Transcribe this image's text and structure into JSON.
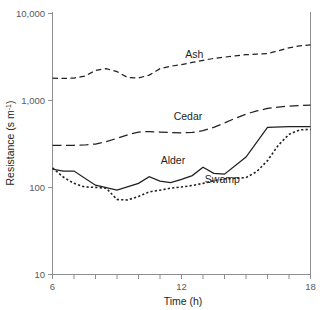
{
  "figure": {
    "name": "resistance-vs-time-line-chart"
  },
  "chart_data": {
    "type": "line",
    "title": "",
    "xlabel": "Time (h)",
    "ylabel": "Resistance (s m⁻¹)",
    "ylabel_parts": {
      "main": "Resistance (s m",
      "exponent": "-1",
      "tail": ")"
    },
    "xscale": "linear",
    "yscale": "log",
    "xlim": [
      6,
      18
    ],
    "ylim": [
      10,
      10000
    ],
    "xticks": [
      6,
      7,
      8,
      9,
      10,
      11,
      12,
      13,
      14,
      15,
      16,
      17,
      18
    ],
    "xticklabels": [
      "6",
      "",
      "",
      "",
      "",
      "",
      "12",
      "",
      "",
      "",
      "",
      "",
      "18"
    ],
    "xtick_labels_shown": [
      "6",
      "12",
      "18"
    ],
    "yticks": [
      10,
      100,
      1000,
      10000
    ],
    "yticklabels": [
      "10",
      "100",
      "1,000",
      "10,000"
    ],
    "grid": false,
    "legend": "inline-annotations",
    "series": [
      {
        "name": "Ash",
        "linestyle": "dashed",
        "color": "#231f20",
        "label_position": {
          "x": 12.6,
          "y": 2950
        },
        "x": [
          6.0,
          6.5,
          7.0,
          7.5,
          8.0,
          8.5,
          9.0,
          9.5,
          10.0,
          10.5,
          11.0,
          11.5,
          12.0,
          12.5,
          13.0,
          13.5,
          14.0,
          14.5,
          15.0,
          15.5,
          16.0,
          16.5,
          17.0,
          17.5,
          18.0
        ],
        "y": [
          1750,
          1740,
          1760,
          1850,
          2150,
          2250,
          2080,
          1780,
          1760,
          1900,
          2250,
          2400,
          2500,
          2650,
          2800,
          2950,
          3050,
          3150,
          3250,
          3300,
          3350,
          3600,
          3900,
          4100,
          4200
        ]
      },
      {
        "name": "Cedar",
        "linestyle": "long-dashed",
        "color": "#231f20",
        "label_position": {
          "x": 12.3,
          "y": 590
        },
        "x": [
          6.0,
          6.5,
          7.0,
          7.5,
          8.0,
          8.5,
          9.0,
          9.5,
          10.0,
          10.5,
          11.0,
          11.5,
          12.0,
          12.5,
          13.0,
          13.5,
          14.0,
          14.5,
          15.0,
          15.5,
          16.0,
          16.5,
          17.0,
          17.5,
          18.0
        ],
        "y": [
          300,
          300,
          300,
          302,
          310,
          330,
          360,
          395,
          425,
          430,
          425,
          420,
          415,
          420,
          440,
          480,
          540,
          610,
          680,
          740,
          790,
          820,
          840,
          855,
          860
        ]
      },
      {
        "name": "Alder",
        "linestyle": "solid",
        "color": "#231f20",
        "label_position": {
          "x": 11.6,
          "y": 185
        },
        "x": [
          6.0,
          6.5,
          7.0,
          8.0,
          9.0,
          10.0,
          10.5,
          11.0,
          11.5,
          12.0,
          12.5,
          13.0,
          13.5,
          14.0,
          15.0,
          16.0,
          17.0,
          18.0
        ],
        "y": [
          160,
          152,
          152,
          105,
          92,
          110,
          131,
          117,
          112,
          122,
          135,
          168,
          143,
          140,
          220,
          480,
          490,
          490
        ]
      },
      {
        "name": "Swamp",
        "linestyle": "dotted",
        "color": "#231f20",
        "label_position": {
          "x": 13.9,
          "y": 112
        },
        "x": [
          6.0,
          6.5,
          7.0,
          7.5,
          8.0,
          8.5,
          9.0,
          9.5,
          10.0,
          10.5,
          11.0,
          11.5,
          12.0,
          12.5,
          13.0,
          13.5,
          14.0,
          14.5,
          15.0,
          15.5,
          16.0,
          16.5,
          17.0,
          17.5,
          18.0
        ],
        "y": [
          165,
          130,
          110,
          100,
          99,
          97,
          72,
          71,
          78,
          88,
          92,
          97,
          100,
          104,
          110,
          118,
          124,
          126,
          128,
          150,
          200,
          300,
          400,
          450,
          455
        ]
      }
    ]
  }
}
